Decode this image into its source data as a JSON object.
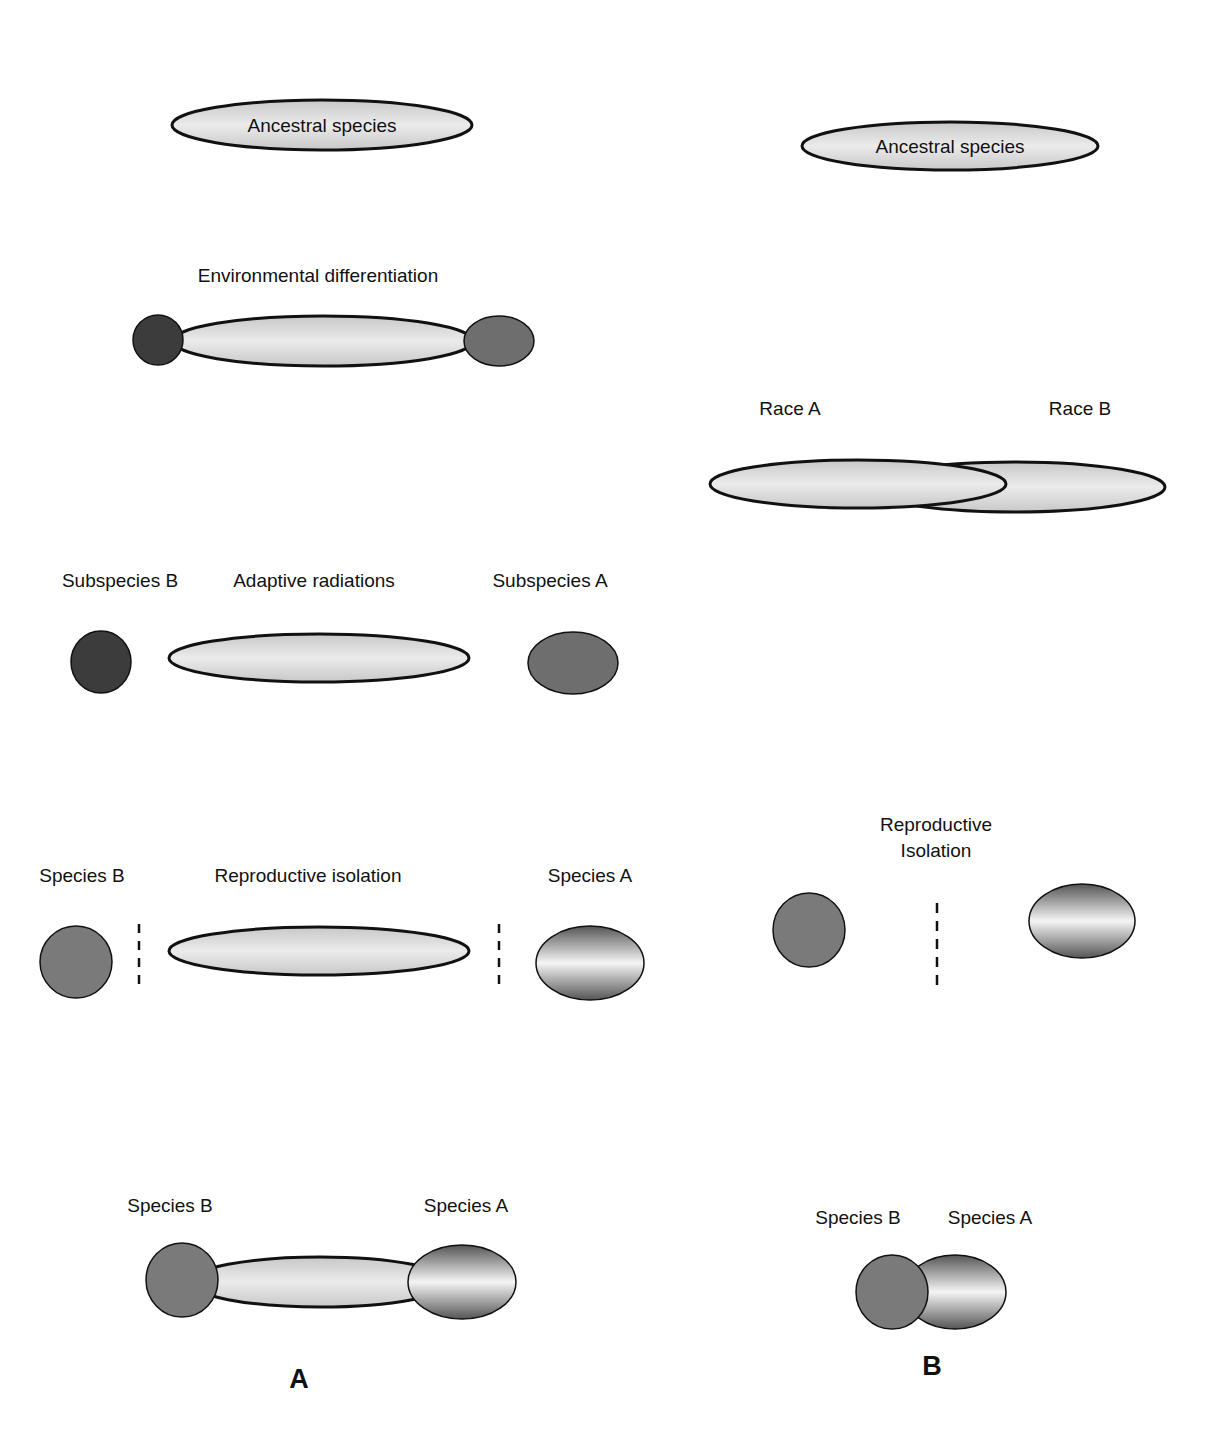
{
  "colors": {
    "stroke": "#111111",
    "pale_fill_light": "#e6e6e6",
    "pale_fill_dark": "#c4c4c4",
    "dark_subspecies": "#3c3c3c",
    "mid_subspecies": "#6e6e6e",
    "species_b": "#7a7a7a",
    "species_a_edge": "#5a5a5a",
    "species_a_center": "#f4f4f4"
  },
  "panel_a": {
    "panel_label": "A",
    "stage1": {
      "center_label": "Ancestral species"
    },
    "stage2": {
      "title": "Environmental differentiation"
    },
    "stage3": {
      "left_label": "Subspecies B",
      "center_label": "Adaptive radiations",
      "right_label": "Subspecies A"
    },
    "stage4": {
      "left_label": "Species B",
      "center_label": "Reproductive isolation",
      "right_label": "Species A"
    },
    "stage5": {
      "left_label": "Species B",
      "right_label": "Species A"
    }
  },
  "panel_b": {
    "panel_label": "B",
    "stage1": {
      "center_label": "Ancestral species"
    },
    "stage2": {
      "left_label": "Race A",
      "right_label": "Race B"
    },
    "stage3": {
      "title_line1": "Reproductive",
      "title_line2": "Isolation"
    },
    "stage4": {
      "left_label": "Species B",
      "right_label": "Species A"
    }
  }
}
